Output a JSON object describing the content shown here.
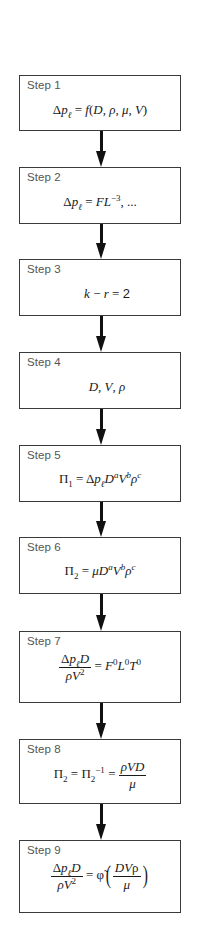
{
  "diagram": {
    "type": "flowchart",
    "direction": "top-to-bottom",
    "colors": {
      "box_border": "#3a3a3a",
      "label_text": "#555555",
      "formula_text": "#1a1a1a",
      "arrow": "#111111"
    },
    "steps": [
      {
        "label": "Step 1",
        "formula": "Δp_ℓ = f(D, ρ, μ, V)"
      },
      {
        "label": "Step 2",
        "formula": "Δp_ℓ = FL^−3, ..."
      },
      {
        "label": "Step 3",
        "formula": "k − r = 2"
      },
      {
        "label": "Step 4",
        "formula": "D, V, ρ"
      },
      {
        "label": "Step 5",
        "formula": "Π_1 = Δp_ℓ D^a V^b ρ^c"
      },
      {
        "label": "Step 6",
        "formula": "Π_2 = μ D^a V^b ρ^c"
      },
      {
        "label": "Step 7",
        "formula": "Δp_ℓ D / ρV^2 = F^0 L^0 T^0"
      },
      {
        "label": "Step 8",
        "formula": "Π_2 = Π_2^−1 = ρVD / μ"
      },
      {
        "label": "Step 9",
        "formula": "Δp_ℓ D / ρV^2 = φ̃(DVρ / μ)"
      }
    ],
    "glyphs": {
      "delta": "Δ",
      "p": "p",
      "ell": "ℓ",
      "eq": "=",
      "f": "f",
      "D": "D",
      "rho": "ρ",
      "mu": "μ",
      "V": "V",
      "comma": ",",
      "F": "F",
      "L": "L",
      "T": "T",
      "k": "k",
      "r": "r",
      "minus": "−",
      "two": "2",
      "Pi": "Π",
      "one": "1",
      "a": "a",
      "b": "b",
      "c": "c",
      "zero": "0",
      "neg3": "−3",
      "neg1": "−1",
      "ellipsis": "...",
      "phi_tilde": "φ̃",
      "lparen": "(",
      "rparen": ")",
      "lparen_big": "(",
      "rparen_big": ")"
    }
  }
}
